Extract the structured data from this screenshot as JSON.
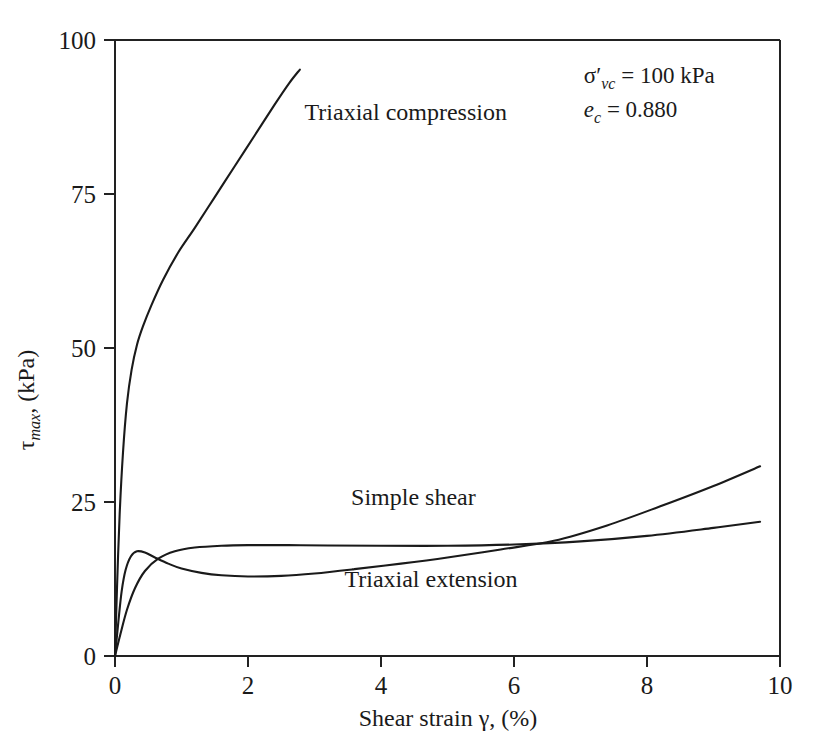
{
  "chart_data": {
    "type": "line",
    "title": "",
    "xlabel": "Shear strain γ, (%)",
    "ylabel": "τmax, (kPa)",
    "ylabel_main": "τ",
    "ylabel_sub": "max",
    "ylabel_tail": ", (kPa)",
    "xlim": [
      0,
      10
    ],
    "ylim": [
      0,
      100
    ],
    "xticks": [
      0,
      2,
      4,
      6,
      8,
      10
    ],
    "xtick_labels": [
      "0",
      "2",
      "4",
      "6",
      "8",
      "10"
    ],
    "yticks": [
      0,
      25,
      50,
      75,
      100
    ],
    "ytick_labels": [
      "0",
      "25",
      "50",
      "75",
      "100"
    ],
    "grid": false,
    "legend_position": "inline-labels",
    "series": [
      {
        "name": "Triaxial compression",
        "label": "Triaxial compression",
        "label_x": 2.85,
        "label_y": 87.0,
        "x": [
          0.0,
          0.03,
          0.07,
          0.12,
          0.18,
          0.25,
          0.33,
          0.42,
          0.55,
          0.72,
          0.95,
          1.2,
          1.5,
          1.8,
          2.1,
          2.4,
          2.62,
          2.78
        ],
        "y": [
          0.0,
          11.0,
          23.0,
          33.0,
          41.0,
          46.5,
          50.5,
          53.5,
          57.0,
          61.0,
          65.5,
          69.5,
          74.5,
          79.5,
          84.5,
          89.5,
          93.0,
          95.2
        ]
      },
      {
        "name": "Simple shear",
        "label": "Simple shear",
        "label_x": 3.55,
        "label_y": 24.5,
        "x": [
          0.0,
          0.08,
          0.18,
          0.3,
          0.45,
          0.65,
          0.9,
          1.2,
          1.6,
          2.0,
          2.6,
          3.2,
          4.0,
          5.0,
          6.0,
          7.0,
          8.0,
          9.0,
          9.7
        ],
        "y": [
          0.0,
          3.5,
          7.5,
          11.0,
          13.8,
          15.8,
          17.0,
          17.6,
          17.9,
          18.0,
          18.0,
          17.95,
          17.9,
          17.9,
          18.1,
          18.6,
          19.5,
          20.8,
          21.8
        ]
      },
      {
        "name": "Triaxial extension",
        "label": "Triaxial extension",
        "label_x": 3.45,
        "label_y": 11.2,
        "x": [
          0.0,
          0.05,
          0.1,
          0.16,
          0.24,
          0.33,
          0.45,
          0.6,
          0.8,
          1.0,
          1.3,
          1.6,
          2.0,
          2.5,
          3.0,
          3.6,
          4.3,
          5.0,
          5.8,
          6.6,
          7.4,
          8.2,
          9.0,
          9.7
        ],
        "y": [
          0.0,
          5.5,
          10.5,
          14.0,
          16.2,
          17.0,
          16.8,
          16.0,
          15.0,
          14.2,
          13.5,
          13.1,
          12.9,
          13.0,
          13.4,
          14.1,
          15.0,
          16.0,
          17.3,
          18.7,
          21.2,
          24.3,
          27.6,
          30.8
        ]
      }
    ],
    "annotations": [
      {
        "name": "confining-stress",
        "text": "σ′vc = 100 kPa",
        "symbol": "σ′",
        "sub": "vc",
        "value": "= 100 kPa",
        "x": 7.05,
        "y": 93.0
      },
      {
        "name": "void-ratio",
        "text": "ec = 0.880",
        "symbol": "e",
        "sub": "c",
        "value": "= 0.880",
        "x": 7.05,
        "y": 87.5
      }
    ],
    "colors": {
      "axis": "#222222",
      "curve": "#1a1a1a",
      "background": "#ffffff",
      "text": "#1a1a1a"
    }
  }
}
